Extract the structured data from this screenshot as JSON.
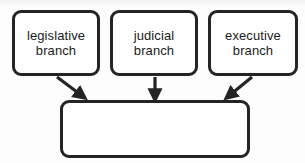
{
  "diagram": {
    "type": "flowchart",
    "orientation": "top-to-bottom-convergent",
    "background_color": "#fdfdfd",
    "border_color": "#242424",
    "node_fill_color": "#ffffff",
    "text_color": "#1b1b1b",
    "nodes": [
      {
        "id": "legislative",
        "label": "legislative\nbranch",
        "line1": "legislative",
        "line2": "branch",
        "shape": "rounded-rectangle",
        "row": "top"
      },
      {
        "id": "judicial",
        "label": "judicial\nbranch",
        "line1": "judicial",
        "line2": "branch",
        "shape": "rounded-rectangle",
        "row": "top"
      },
      {
        "id": "executive",
        "label": "executive\nbranch",
        "line1": "executive",
        "line2": "branch",
        "shape": "rounded-rectangle",
        "row": "top"
      },
      {
        "id": "answer",
        "label": "",
        "shape": "rounded-rectangle",
        "row": "bottom",
        "empty": true
      }
    ],
    "edges": [
      {
        "id": "edge-legislative-answer",
        "from": "legislative",
        "to": "answer",
        "style": "solid-arrow",
        "direction": "diagonal-down-right"
      },
      {
        "id": "edge-judicial-answer",
        "from": "judicial",
        "to": "answer",
        "style": "solid-arrow",
        "direction": "vertical-down"
      },
      {
        "id": "edge-executive-answer",
        "from": "executive",
        "to": "answer",
        "style": "solid-arrow",
        "direction": "diagonal-down-left"
      }
    ]
  }
}
